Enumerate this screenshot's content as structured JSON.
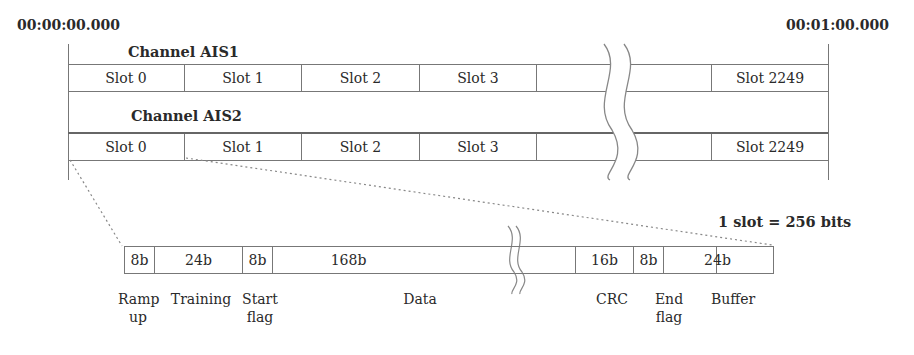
{
  "timeline": {
    "start_time": "00:00:00.000",
    "end_time": "00:01:00.000"
  },
  "channels": [
    {
      "label": "Channel AIS1",
      "slots": [
        "Slot 0",
        "Slot 1",
        "Slot 2",
        "Slot 3",
        "",
        "",
        "Slot 2249"
      ]
    },
    {
      "label": "Channel AIS2",
      "slots": [
        "Slot 0",
        "Slot 1",
        "Slot 2",
        "Slot 3",
        "",
        "",
        "Slot 2249"
      ]
    }
  ],
  "slot_detail": {
    "caption": "1 slot = 256 bits",
    "fields": [
      {
        "bits": "8b",
        "name_line1": "Ramp",
        "name_line2": "up"
      },
      {
        "bits": "24b",
        "name_line1": "Training",
        "name_line2": ""
      },
      {
        "bits": "8b",
        "name_line1": "Start",
        "name_line2": "flag"
      },
      {
        "bits": "168b",
        "name_line1": "Data",
        "name_line2": ""
      },
      {
        "bits": "16b",
        "name_line1": "CRC",
        "name_line2": ""
      },
      {
        "bits": "8b",
        "name_line1": "End",
        "name_line2": "flag"
      },
      {
        "bits": "24b",
        "name_line1": "Buffer",
        "name_line2": ""
      }
    ]
  },
  "colors": {
    "line": "#777777",
    "text": "#2a2a2a",
    "background": "#ffffff"
  }
}
